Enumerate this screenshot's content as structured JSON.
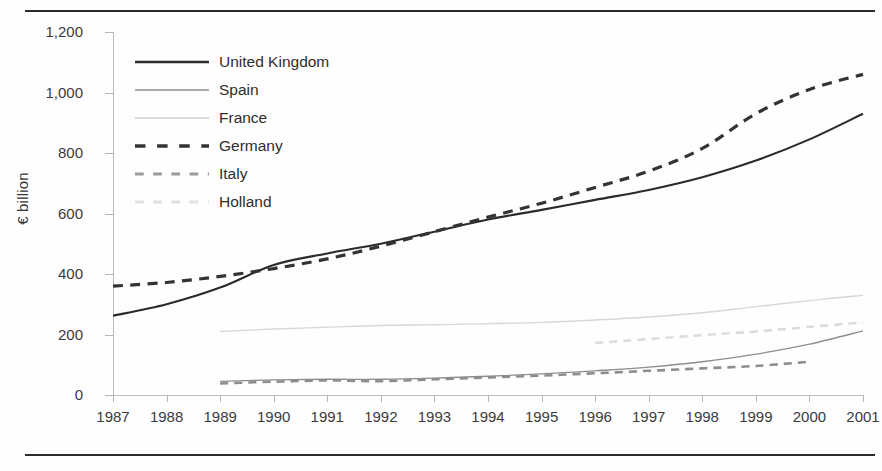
{
  "chart_data": {
    "type": "line",
    "title": "",
    "xlabel": "",
    "ylabel": "€ billion",
    "x": [
      1987,
      1988,
      1989,
      1990,
      1991,
      1992,
      1993,
      1994,
      1995,
      1996,
      1997,
      1998,
      1999,
      2000,
      2001
    ],
    "xticklabels": [
      "1987",
      "1988",
      "1989",
      "1990",
      "1991",
      "1992",
      "1993",
      "1994",
      "1995",
      "1996",
      "1997",
      "1998",
      "1999",
      "2000",
      "2001"
    ],
    "yticklabels": [
      "0",
      "200",
      "400",
      "600",
      "800",
      "1,000",
      "1,200"
    ],
    "yticks": [
      0,
      200,
      400,
      600,
      800,
      1000,
      1200
    ],
    "ylim": [
      0,
      1200
    ],
    "xlim": [
      1987,
      2001
    ],
    "grid": false,
    "legend_position": "upper-left-inside",
    "series": [
      {
        "name": "United Kingdom",
        "style": "solid",
        "color": "#2b2b2b",
        "width": 2.1,
        "values": [
          262,
          300,
          355,
          430,
          468,
          500,
          540,
          580,
          612,
          645,
          678,
          720,
          775,
          845,
          930
        ]
      },
      {
        "name": "Spain",
        "style": "solid",
        "color": "#8d8d8d",
        "width": 1.3,
        "values": [
          null,
          null,
          45,
          50,
          52,
          52,
          56,
          62,
          70,
          80,
          92,
          110,
          135,
          168,
          212
        ]
      },
      {
        "name": "France",
        "style": "solid",
        "color": "#d8d8d8",
        "width": 1.4,
        "values": [
          null,
          null,
          210,
          218,
          224,
          230,
          232,
          236,
          240,
          248,
          258,
          272,
          292,
          312,
          330
        ]
      },
      {
        "name": "Germany",
        "style": "dashed",
        "color": "#333333",
        "width": 3.2,
        "values": [
          360,
          372,
          392,
          418,
          450,
          492,
          540,
          588,
          634,
          686,
          740,
          815,
          930,
          1010,
          1060
        ]
      },
      {
        "name": "Italy",
        "style": "dashed",
        "color": "#8d8d8d",
        "width": 2.6,
        "values": [
          null,
          null,
          38,
          44,
          48,
          46,
          52,
          58,
          64,
          72,
          80,
          88,
          96,
          110,
          null
        ]
      },
      {
        "name": "Holland",
        "style": "dashed",
        "color": "#dcdcdc",
        "width": 2.6,
        "values": [
          null,
          null,
          null,
          null,
          null,
          null,
          null,
          null,
          null,
          172,
          185,
          198,
          210,
          225,
          240
        ]
      }
    ]
  },
  "legend": {
    "items": [
      {
        "label": "United Kingdom",
        "style": "solid",
        "color": "#2b2b2b",
        "width": 2.4
      },
      {
        "label": "Spain",
        "style": "solid",
        "color": "#8d8d8d",
        "width": 1.5
      },
      {
        "label": "France",
        "style": "solid",
        "color": "#dcdcdc",
        "width": 1.8
      },
      {
        "label": "Germany",
        "style": "dashed",
        "color": "#333333",
        "width": 3.4
      },
      {
        "label": "Italy",
        "style": "dashed",
        "color": "#9a9a9a",
        "width": 2.8
      },
      {
        "label": "Holland",
        "style": "dashed",
        "color": "#e0e0e0",
        "width": 2.8
      }
    ]
  },
  "colors": {
    "rule": "#2b2b2b",
    "axis": "#bdbdbd",
    "text": "#3b3b3b",
    "background": "#ffffff"
  }
}
